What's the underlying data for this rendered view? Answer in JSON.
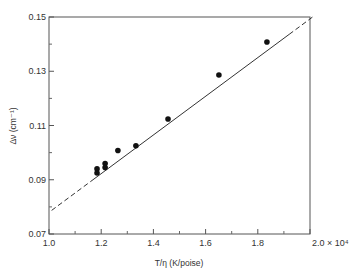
{
  "chart_data": {
    "type": "scatter",
    "title": "",
    "xlabel": "T/η (K/poise)",
    "ylabel": "Δν (cm⁻¹)",
    "x_scale_note": "× 10⁴",
    "xlim": [
      1.0,
      2.0
    ],
    "ylim": [
      0.07,
      0.15
    ],
    "x_ticks": [
      1.0,
      1.2,
      1.4,
      1.6,
      1.8,
      2.0
    ],
    "x_tick_labels": [
      "1.0",
      "1.2",
      "1.4",
      "1.6",
      "1.8",
      "2.0 × 10⁴"
    ],
    "x_minor_ticks": [
      1.1,
      1.3,
      1.5,
      1.7,
      1.9
    ],
    "y_ticks": [
      0.07,
      0.09,
      0.11,
      0.13,
      0.15
    ],
    "y_tick_labels": [
      "0.07",
      "0.09",
      "0.11",
      "0.13",
      "0.15"
    ],
    "y_minor_ticks": [
      0.08,
      0.1,
      0.12,
      0.14
    ],
    "grid": false,
    "legend": null,
    "series": [
      {
        "name": "measured",
        "marker": "filled-circle",
        "x": [
          1.184,
          1.184,
          1.215,
          1.215,
          1.264,
          1.333,
          1.456,
          1.651,
          1.835
        ],
        "y": [
          0.094,
          0.0925,
          0.096,
          0.0945,
          0.1008,
          0.1025,
          0.1124,
          0.1286,
          0.1408
        ]
      },
      {
        "name": "linear fit",
        "style": "line",
        "solid_range": [
          1.16,
          1.92
        ],
        "dashed_extension": true,
        "x": [
          1.01,
          2.01
        ],
        "y": [
          0.0787,
          0.15
        ]
      }
    ]
  }
}
